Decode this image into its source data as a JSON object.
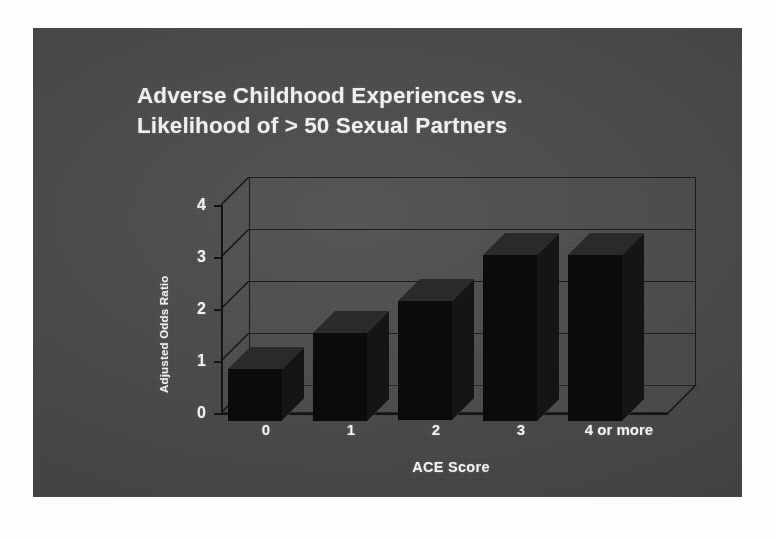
{
  "slide": {
    "background_color": "#4a4a4a",
    "title_line1": "Adverse Childhood Experiences vs.",
    "title_line2": "Likelihood of  > 50  Sexual Partners"
  },
  "chart_data": {
    "type": "bar",
    "title": "Adverse Childhood Experiences vs. Likelihood of > 50 Sexual Partners",
    "xlabel": "ACE Score",
    "ylabel": "Adjusted Odds Ratio",
    "categories": [
      "0",
      "1",
      "2",
      "3",
      "4 or more"
    ],
    "values": [
      1.0,
      1.7,
      2.3,
      3.2,
      3.2
    ],
    "ytick_labels": [
      "0",
      "1",
      "2",
      "3",
      "4"
    ],
    "ytick_values": [
      0,
      1,
      2,
      3,
      4
    ],
    "ylim": [
      0,
      4
    ],
    "grid": true,
    "legend": false,
    "style": "3d-column",
    "bar_color": "#0b0b0b",
    "plot_background": "#4a4a4a",
    "axis_color": "#161616",
    "text_color": "#f0f0f0"
  }
}
